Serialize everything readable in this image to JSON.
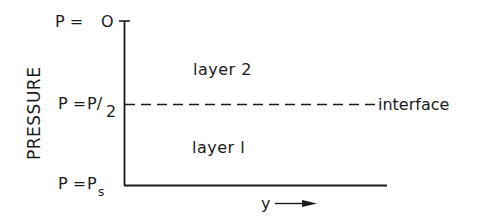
{
  "diagram": {
    "axis_title": "PRESSURE",
    "y_levels": [
      {
        "name": "top",
        "prefix": "P =",
        "value": "O",
        "sub": ""
      },
      {
        "name": "interface",
        "prefix": "P =",
        "value": "P/",
        "sub": "2"
      },
      {
        "name": "surface",
        "prefix": "P =",
        "value": "P",
        "sub": "s"
      }
    ],
    "regions": {
      "upper": "layer  2",
      "lower": "layer  l"
    },
    "interface_label": "interface",
    "x_axis_label": "y",
    "colors": {
      "ink": "#1a1a1a",
      "background": "#ffffff"
    }
  }
}
